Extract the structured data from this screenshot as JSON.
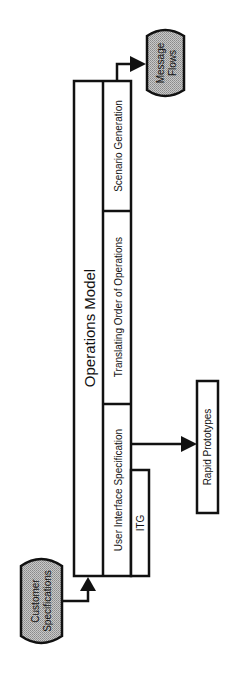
{
  "diagram": {
    "main_block": {
      "title": "Operations Model",
      "sections": [
        {
          "label": "Scenario Generation"
        },
        {
          "label": "Translating Order of Operations"
        },
        {
          "label": "User Interface Specification"
        }
      ],
      "sub_block": {
        "label": "ITG"
      }
    },
    "inputs": [
      {
        "label_line1": "Customer",
        "label_line2": "Specifications"
      }
    ],
    "outputs": [
      {
        "label_line1": "Message",
        "label_line2": "Flows"
      },
      {
        "label": "Rapid Prototypes"
      }
    ],
    "colors": {
      "stroke": "#111111",
      "terminal_fill": "#b3b3b3",
      "background": "#ffffff"
    }
  }
}
